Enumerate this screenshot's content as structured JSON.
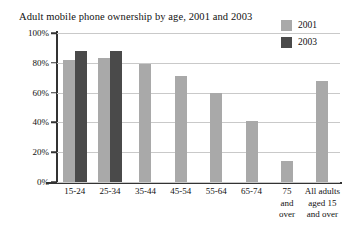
{
  "chart_data": {
    "type": "bar",
    "title": "Adult mobile phone ownership by age, 2001 and 2003",
    "xlabel": "",
    "ylabel": "",
    "ylim": [
      0,
      100
    ],
    "ytick_labels": [
      "100%",
      "80%",
      "60%",
      "40%",
      "20%",
      "0%"
    ],
    "ytick_values": [
      100,
      80,
      60,
      40,
      20,
      0
    ],
    "grid": true,
    "legend_position": "top-right",
    "categories": [
      "15-24",
      "25-34",
      "35-44",
      "45-54",
      "55-64",
      "65-74",
      "75\nand\nover",
      "All adults\naged 15\nand over"
    ],
    "series": [
      {
        "name": "2001",
        "color": "#a9a9a9",
        "values": [
          82,
          83,
          79,
          71,
          60,
          41,
          14,
          68
        ]
      },
      {
        "name": "2003",
        "color": "#4a4a4a",
        "values": [
          88,
          88,
          null,
          null,
          null,
          null,
          null,
          null
        ]
      }
    ]
  },
  "colors": {
    "series_2001": "#a9a9a9",
    "series_2003": "#4a4a4a",
    "gridline": "#c9c9c9",
    "axis": "#333333",
    "text": "#111111",
    "background": "#ffffff"
  }
}
